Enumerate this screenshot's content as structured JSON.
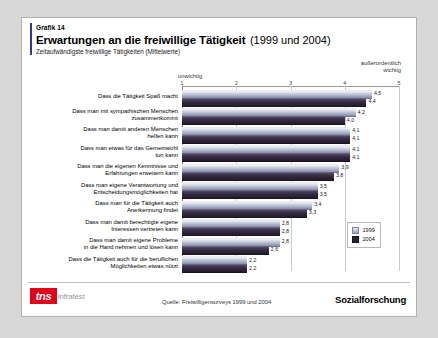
{
  "header": {
    "graphik_number": "Grafik 14",
    "title": "Erwartungen an die freiwillige Tätigkeit",
    "title_years": "(1999 und 2004)",
    "subtitle": "Zeitaufwändigste freiwillige Tätigkeiten (Mittelwerte)"
  },
  "footer": {
    "logo_mark": "tns",
    "logo_word": "infratest",
    "source": "Quelle: Freiwilligensurveys 1999 und 2004",
    "brand": "Sozialforschung"
  },
  "colors": {
    "accent_rule": "#2b3a8f",
    "logo_red": "#e2001a",
    "series_1999": "#a3abc4",
    "series_2004": "#2b2236"
  },
  "chart_data": {
    "type": "bar",
    "orientation": "horizontal",
    "title": "Erwartungen an die freiwillige Tätigkeit (1999 und 2004)",
    "subtitle": "Zeitaufwändigste freiwillige Tätigkeiten (Mittelwerte)",
    "xlabel": "",
    "ylabel": "",
    "xlim": [
      1,
      5
    ],
    "ticks": [
      "1",
      "2",
      "3",
      "4",
      "5"
    ],
    "scale_low_label": "unwichtig",
    "scale_high_label": "außerordentlich\nwichtig",
    "scale_high_label_line1": "außerordentlich",
    "scale_high_label_line2": "wichtig",
    "grid": true,
    "legend_position": "right-bottom",
    "categories": [
      "Dass die Tätigkeit Spaß macht",
      "Dass  man mit sympathischen Menschen zusammenkommt",
      "Dass man damit anderen Menschen helfen kann",
      "Dass man etwas für das Gemeinwohl tun kann",
      "Dass man die eigenen Kenntnisse und Erfahrungen erweitern kann",
      "Dass man eigene Verantwortung und Entscheidungsmöglichkeiten hat",
      "Dass man für die Tätigkeit auch Anerkennung findet",
      "Dass man damit berechtigte eigene Interessen vertreten kann",
      "Dass man damit eigene Probleme in die Hand nehmen und lösen kann",
      "Dass die Tätigkeit auch für die beruflichen Möglichkeiten etwas nützt"
    ],
    "category_lines": [
      [
        "Dass die Tätigkeit Spaß macht"
      ],
      [
        "Dass  man mit sympathischen Menschen",
        "zusammenkommt"
      ],
      [
        "Dass man damit anderen Menschen",
        "helfen kann"
      ],
      [
        "Dass man etwas für das Gemeinwohl",
        "tun kann"
      ],
      [
        "Dass man die eigenen Kenntnisse und",
        "Erfahrungen erweitern kann"
      ],
      [
        "Dass man eigene Verantwortung und",
        "Entscheidungsmöglichkeiten hat"
      ],
      [
        "Dass man für die Tätigkeit auch",
        "Anerkennung findet"
      ],
      [
        "Dass man damit berechtigte eigene",
        "Interessen vertreten kann"
      ],
      [
        "Dass man damit eigene Probleme",
        "in die Hand nehmen und lösen kann"
      ],
      [
        "Dass die Tätigkeit auch für die beruflichen",
        "Möglichkeiten etwas nützt"
      ]
    ],
    "series": [
      {
        "name": "1999",
        "values": [
          4.5,
          4.2,
          4.1,
          4.1,
          3.9,
          3.5,
          3.4,
          2.8,
          2.8,
          2.2
        ],
        "labels": [
          "4,5",
          "4,2",
          "4,1",
          "4,1",
          "3,9",
          "3,5",
          "3,4",
          "2,8",
          "2,8",
          "2,2"
        ]
      },
      {
        "name": "2004",
        "values": [
          4.4,
          4.0,
          4.1,
          4.1,
          3.8,
          3.5,
          3.3,
          2.8,
          2.6,
          2.2
        ],
        "labels": [
          "4,4",
          "4,0",
          "4,1",
          "4,1",
          "3,8",
          "3,5",
          "3,3",
          "2,8",
          "2,6",
          "2,2"
        ]
      }
    ],
    "legend": [
      {
        "label": "1999",
        "color": "#a3abc4"
      },
      {
        "label": "2004",
        "color": "#2b2236"
      }
    ]
  }
}
